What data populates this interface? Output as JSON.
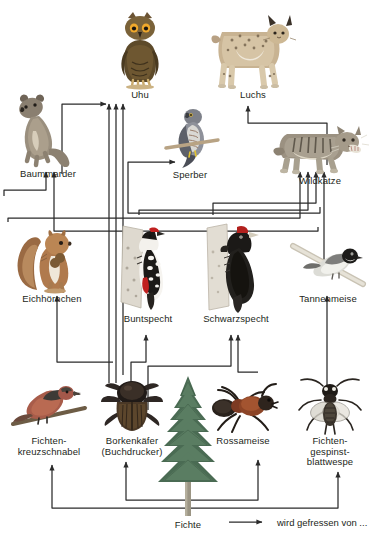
{
  "diagram": {
    "background_color": "#ffffff",
    "line_color": "#2b2b2b",
    "text_color": "#231f20",
    "legend": {
      "arrow_name": "eaten-by-arrow",
      "label": "wird gefressen von ..."
    },
    "relation_label": "wird gefressen von ..."
  },
  "nodes": [
    {
      "id": "uhu",
      "label": "Uhu",
      "x": 140,
      "y": 95,
      "incoming_arrows": 3,
      "trophic_level": "top-predator"
    },
    {
      "id": "luchs",
      "label": "Luchs",
      "x": 252,
      "y": 95,
      "incoming_arrows": 1,
      "trophic_level": "top-predator"
    },
    {
      "id": "baummarder",
      "label": "Baummarder",
      "x": 48,
      "y": 178,
      "incoming_arrows": 2,
      "trophic_level": "predator"
    },
    {
      "id": "sperber",
      "label": "Sperber",
      "x": 190,
      "y": 178,
      "incoming_arrows": 1,
      "trophic_level": "predator"
    },
    {
      "id": "wildkatze",
      "label": "Wildkatze",
      "x": 320,
      "y": 178,
      "incoming_arrows": 4,
      "trophic_level": "predator"
    },
    {
      "id": "eichhoernchen",
      "label": "Eichhörnchen",
      "x": 52,
      "y": 300,
      "incoming_arrows": 1,
      "trophic_level": "consumer"
    },
    {
      "id": "buntspecht",
      "label": "Buntspecht",
      "x": 148,
      "y": 322,
      "incoming_arrows": 1,
      "trophic_level": "consumer"
    },
    {
      "id": "schwarzspecht",
      "label": "Schwarzspecht",
      "x": 236,
      "y": 322,
      "incoming_arrows": 2,
      "trophic_level": "consumer"
    },
    {
      "id": "tannenmeise",
      "label": "Tannenmeise",
      "x": 327,
      "y": 300,
      "incoming_arrows": 1,
      "trophic_level": "consumer"
    },
    {
      "id": "kreuzschnabel",
      "label": "Fichten-\nkreuzschnabel",
      "x": 48,
      "y": 440,
      "incoming_arrows": 1,
      "trophic_level": "primary-consumer"
    },
    {
      "id": "borkenkaefer",
      "label": "Borkenkäfer\n(Buchdrucker)",
      "x": 131,
      "y": 440,
      "incoming_arrows": 1,
      "trophic_level": "primary-consumer"
    },
    {
      "id": "rossameise",
      "label": "Rossameise",
      "x": 243,
      "y": 440,
      "incoming_arrows": 1,
      "trophic_level": "primary-consumer"
    },
    {
      "id": "blattwespe",
      "label": "Fichten-\ngespinst-\nblattwespe",
      "x": 328,
      "y": 440,
      "incoming_arrows": 1,
      "trophic_level": "primary-consumer"
    },
    {
      "id": "fichte",
      "label": "Fichte",
      "x": 188,
      "y": 525,
      "incoming_arrows": 0,
      "trophic_level": "producer"
    }
  ],
  "edges": [
    {
      "from": "baummarder",
      "to": "uhu",
      "label": "wird gefressen von ..."
    },
    {
      "from": "eichhoernchen",
      "to": "uhu",
      "label": "wird gefressen von ..."
    },
    {
      "from": "buntspecht",
      "to": "uhu",
      "label": "wird gefressen von ..."
    },
    {
      "from": "schwarzspecht",
      "to": "uhu",
      "label": "wird gefressen von ..."
    },
    {
      "from": "wildkatze",
      "to": "luchs",
      "label": "wird gefressen von ..."
    },
    {
      "from": "eichhoernchen",
      "to": "baummarder",
      "label": "wird gefressen von ..."
    },
    {
      "from": "tannenmeise",
      "to": "baummarder",
      "label": "wird gefressen von ..."
    },
    {
      "from": "tannenmeise",
      "to": "sperber",
      "label": "wird gefressen von ..."
    },
    {
      "from": "eichhoernchen",
      "to": "wildkatze",
      "label": "wird gefressen von ..."
    },
    {
      "from": "buntspecht",
      "to": "wildkatze",
      "label": "wird gefressen von ..."
    },
    {
      "from": "schwarzspecht",
      "to": "wildkatze",
      "label": "wird gefressen von ..."
    },
    {
      "from": "tannenmeise",
      "to": "wildkatze",
      "label": "wird gefressen von ..."
    },
    {
      "from": "kreuzschnabel",
      "to": "eichhoernchen",
      "label": "wird gefressen von ..."
    },
    {
      "from": "borkenkaefer",
      "to": "buntspecht",
      "label": "wird gefressen von ..."
    },
    {
      "from": "borkenkaefer",
      "to": "schwarzspecht",
      "label": "wird gefressen von ..."
    },
    {
      "from": "rossameise",
      "to": "schwarzspecht",
      "label": "wird gefressen von ..."
    },
    {
      "from": "blattwespe",
      "to": "tannenmeise",
      "label": "wird gefressen von ..."
    },
    {
      "from": "fichte",
      "to": "kreuzschnabel",
      "label": "wird gefressen von ..."
    },
    {
      "from": "fichte",
      "to": "borkenkaefer",
      "label": "wird gefressen von ..."
    },
    {
      "from": "fichte",
      "to": "rossameise",
      "label": "wird gefressen von ..."
    },
    {
      "from": "fichte",
      "to": "blattwespe",
      "label": "wird gefressen von ..."
    }
  ]
}
